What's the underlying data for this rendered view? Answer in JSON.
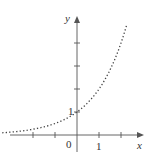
{
  "chart_data": {
    "type": "line",
    "title": "",
    "function": "y = 2^x",
    "xlabel": "x",
    "ylabel": "y",
    "x_tick_labels": [
      "0",
      "1"
    ],
    "y_tick_labels": [
      "1"
    ],
    "x_ticks": [
      -2,
      -1,
      1,
      2
    ],
    "y_ticks": [
      1,
      2,
      3,
      4
    ],
    "xlim": [
      -3.4,
      2.5
    ],
    "ylim": [
      -0.6,
      4.9
    ],
    "line_style": "dotted",
    "grid": false,
    "x": [
      -3.4,
      -3,
      -2.5,
      -2,
      -1.5,
      -1,
      -0.5,
      0,
      0.5,
      1,
      1.5,
      2,
      2.27
    ],
    "values": [
      0.09,
      0.125,
      0.18,
      0.25,
      0.35,
      0.5,
      0.71,
      1,
      1.41,
      2,
      2.83,
      4,
      4.82
    ]
  },
  "labels": {
    "x_axis": "x",
    "y_axis": "y",
    "origin": "0",
    "x_one": "1",
    "y_one": "1"
  },
  "colors": {
    "axis": "#555555",
    "curve": "#444444"
  }
}
